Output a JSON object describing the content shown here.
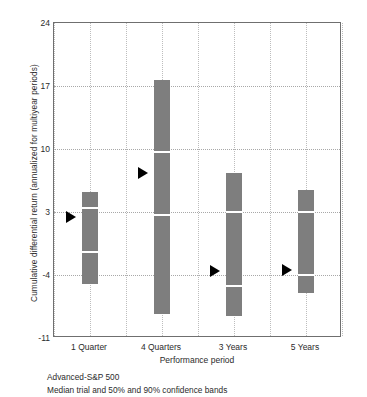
{
  "chart_data": {
    "type": "bar",
    "title": "",
    "xlabel": "Performance period",
    "ylabel": "Cumulative differential return (annualized for multiyear periods)",
    "categories": [
      "1 Quarter",
      "4 Quarters",
      "3 Years",
      "5 Years"
    ],
    "ylim": [
      -11,
      24
    ],
    "yticks": [
      24,
      17,
      10,
      3,
      -4,
      -11
    ],
    "ytick_labels": [
      "24",
      "17",
      "10",
      "3",
      "-4",
      "-11"
    ],
    "grid": true,
    "legend": "none",
    "series_description": "Median trial and 50% and 90% confidence bands",
    "bar_color": "#7e7e7e",
    "median_marker": "right-pointing-triangle",
    "median_marker_color": "#000000",
    "points": [
      {
        "category": "1 Quarter",
        "p05": -5.0,
        "p25": -1.4,
        "median": 2.5,
        "p75": 3.4,
        "p95": 5.2
      },
      {
        "category": "4 Quarters",
        "p05": -8.3,
        "p25": 2.7,
        "median": 7.3,
        "p75": 9.7,
        "p95": 17.7
      },
      {
        "category": "3 Years",
        "p05": -8.6,
        "p25": -5.2,
        "median": -3.5,
        "p75": 3.0,
        "p95": 7.3
      },
      {
        "category": "5 Years",
        "p05": -6.0,
        "p25": -4.0,
        "median": -3.4,
        "p75": 3.0,
        "p95": 5.4
      }
    ]
  },
  "caption": {
    "line1": "Advanced-S&P 500",
    "line2": "Median trial and 50% and 90% confidence bands"
  }
}
